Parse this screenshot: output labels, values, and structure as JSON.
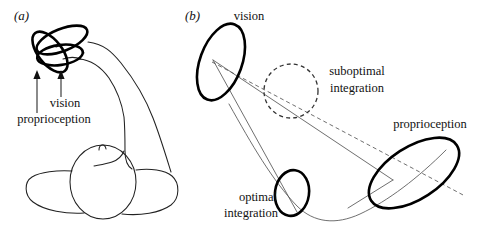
{
  "figure": {
    "width": 493,
    "height": 233,
    "background": "#ffffff",
    "ink_color": "#000000",
    "thin_line_color": "#555555"
  },
  "panels": [
    {
      "id": "a",
      "label": "(a)",
      "label_pos": {
        "x": 14,
        "y": 20
      },
      "description": "Sketch of a seated person with an outstretched arm; three overlapping bold ellipses at the hand denote sensory uncertainty, with arrows labelling vision and proprioception.",
      "annotations": [
        {
          "name": "vision",
          "text": "vision",
          "x": 65,
          "y": 107,
          "anchor": "middle",
          "arrow": {
            "x1": 61,
            "y1": 97,
            "x2": 61,
            "y2": 74
          }
        },
        {
          "name": "proprioception",
          "text": "proprioception",
          "x": 54,
          "y": 123,
          "anchor": "middle",
          "arrow": {
            "x1": 37,
            "y1": 113,
            "x2": 37,
            "y2": 74
          }
        }
      ],
      "ellipses": [
        {
          "name": "ellipse-upper-right",
          "cx": 62,
          "cy": 40,
          "rx": 27,
          "ry": 11,
          "rotate": -22
        },
        {
          "name": "ellipse-left-tilted",
          "cx": 50,
          "cy": 52,
          "rx": 24,
          "ry": 12,
          "rotate": 52
        },
        {
          "name": "ellipse-lower",
          "cx": 60,
          "cy": 55,
          "rx": 23,
          "ry": 10,
          "rotate": -8
        }
      ]
    },
    {
      "id": "b",
      "label": "(b)",
      "label_pos": {
        "x": 185,
        "y": 20
      },
      "description": "Abstract state-space view: large tilted error ellipses for vision and proprioception, a dashed circle for suboptimal integration and a small bold ellipse for optimal integration, connected by thin solid and dashed lines.",
      "annotations": [
        {
          "name": "vision",
          "text": "vision",
          "x": 249,
          "y": 20,
          "anchor": "middle"
        },
        {
          "name": "suboptimal-integration-line1",
          "text": "suboptimal",
          "x": 357,
          "y": 75,
          "anchor": "middle"
        },
        {
          "name": "suboptimal-integration-line2",
          "text": "integration",
          "x": 357,
          "y": 92,
          "anchor": "middle"
        },
        {
          "name": "proprioception",
          "text": "proprioception",
          "x": 430,
          "y": 128,
          "anchor": "middle"
        },
        {
          "name": "optimal-integration-line1",
          "text": "optimal",
          "x": 258,
          "y": 201,
          "anchor": "middle"
        },
        {
          "name": "optimal-integration-line2",
          "text": "integration",
          "x": 251,
          "y": 217,
          "anchor": "middle"
        }
      ],
      "shapes": [
        {
          "name": "vision-ellipse",
          "kind": "solid-bold",
          "cx": 221,
          "cy": 62,
          "rx": 21,
          "ry": 40,
          "rotate": 20
        },
        {
          "name": "suboptimal-integration-circle",
          "kind": "dashed",
          "cx": 291,
          "cy": 91,
          "rx": 27,
          "ry": 27,
          "rotate": 0
        },
        {
          "name": "proprioception-ellipse",
          "kind": "solid-bold",
          "cx": 414,
          "cy": 173,
          "rx": 51,
          "ry": 26,
          "rotate": -33
        },
        {
          "name": "optimal-integration-ellipse",
          "kind": "solid-bold",
          "cx": 292,
          "cy": 193,
          "rx": 17,
          "ry": 23,
          "rotate": 8
        }
      ]
    }
  ]
}
